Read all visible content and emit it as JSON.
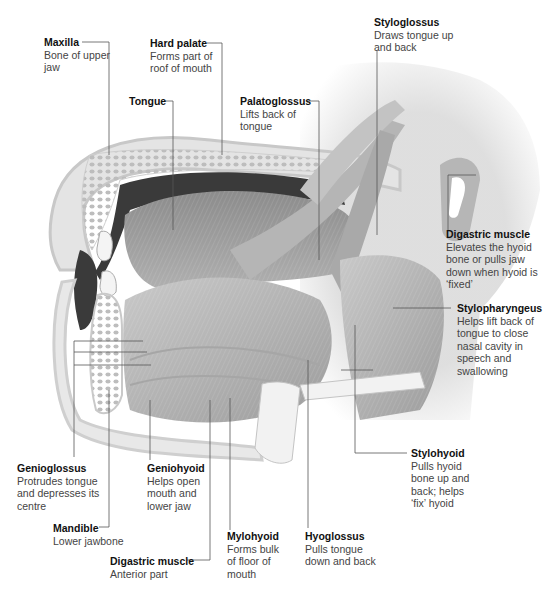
{
  "diagram": {
    "colors": {
      "background": "#ffffff",
      "muscle": "#b8b8b8",
      "muscle_dark": "#8e8e8e",
      "bone": "#e6e6e6",
      "cavity": "#3a3a3a",
      "leader_line": "#555555"
    },
    "labels": [
      {
        "id": "maxilla",
        "title": "Maxilla",
        "desc": "Bone of upper jaw"
      },
      {
        "id": "hard-palate",
        "title": "Hard palate",
        "desc": "Forms part of roof of mouth"
      },
      {
        "id": "tongue",
        "title": "Tongue",
        "desc": ""
      },
      {
        "id": "palatoglossus",
        "title": "Palatoglossus",
        "desc": "Lifts back of tongue"
      },
      {
        "id": "styloglossus",
        "title": "Styloglossus",
        "desc": "Draws tongue up and back"
      },
      {
        "id": "digastric-muscle-posterior",
        "title": "Digastric muscle",
        "desc": "Elevates the hyoid bone or pulls jaw down when hyoid is ‘fixed’"
      },
      {
        "id": "stylopharyngeus",
        "title": "Stylopharyngeus",
        "desc": "Helps lift back of tongue to close nasal cavity in speech and swallowing"
      },
      {
        "id": "stylohyoid",
        "title": "Stylohyoid",
        "desc": "Pulls hyoid bone up and back; helps ‘fix’ hyoid"
      },
      {
        "id": "genioglossus",
        "title": "Genioglossus",
        "desc": "Protrudes tongue and depresses its centre"
      },
      {
        "id": "geniohyoid",
        "title": "Geniohyoid",
        "desc": "Helps open mouth and lower jaw"
      },
      {
        "id": "mandible",
        "title": "Mandible",
        "desc": "Lower jawbone"
      },
      {
        "id": "mylohyoid",
        "title": "Mylohyoid",
        "desc": "Forms bulk of floor of mouth"
      },
      {
        "id": "hyoglossus",
        "title": "Hyoglossus",
        "desc": "Pulls tongue down and back"
      },
      {
        "id": "digastric-muscle-anterior",
        "title": "Digastric muscle",
        "desc": "Anterior part"
      }
    ]
  }
}
